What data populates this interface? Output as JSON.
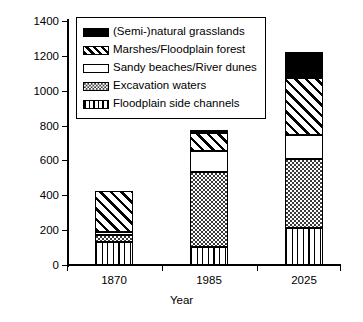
{
  "chart_data": {
    "type": "bar",
    "subtype": "stacked-bar",
    "title": "",
    "xlabel": "Year",
    "ylabel": "Acreage (ha)",
    "categories": [
      "1870",
      "1985",
      "2025"
    ],
    "ylim": [
      0,
      1400
    ],
    "yticks": [
      0,
      200,
      400,
      600,
      800,
      1000,
      1200,
      1400
    ],
    "ytick_labels": [
      "0",
      "200",
      "400",
      "600",
      "800",
      "1000",
      "1200",
      "1400"
    ],
    "grid": false,
    "legend_position": "upper-left-inside",
    "stack_order_bottom_to_top": [
      "Floodplain side channels",
      "Excavation waters",
      "Sandy beaches/River dunes",
      "Marshes/Floodplain forest",
      "(Semi-)natural grasslands"
    ],
    "series": [
      {
        "name": "Floodplain side channels",
        "pattern": "vertical-lines",
        "values": [
          130,
          105,
          215
        ]
      },
      {
        "name": "Excavation waters",
        "pattern": "fine-dots",
        "values": [
          42,
          428,
          395
        ]
      },
      {
        "name": "Sandy beaches/River dunes",
        "pattern": "white",
        "values": [
          18,
          122,
          135
        ]
      },
      {
        "name": "Marshes/Floodplain forest",
        "pattern": "diagonal-hatch",
        "values": [
          235,
          100,
          330
        ]
      },
      {
        "name": "(Semi-)natural grasslands",
        "pattern": "solid-black",
        "values": [
          0,
          20,
          145
        ]
      }
    ],
    "totals": [
      425,
      775,
      1220
    ]
  },
  "legend": {
    "items": [
      {
        "label": "(Semi-)natural grasslands",
        "pattern": "solid-black"
      },
      {
        "label": "Marshes/Floodplain forest",
        "pattern": "diagonal-hatch"
      },
      {
        "label": "Sandy beaches/River dunes",
        "pattern": "white"
      },
      {
        "label": "Excavation waters",
        "pattern": "fine-dots"
      },
      {
        "label": "Floodplain side channels",
        "pattern": "vertical-lines"
      }
    ]
  },
  "colors": {
    "axis": "#000000",
    "text": "#000000",
    "background": "#ffffff",
    "fill_black": "#000000",
    "fill_white": "#ffffff"
  }
}
